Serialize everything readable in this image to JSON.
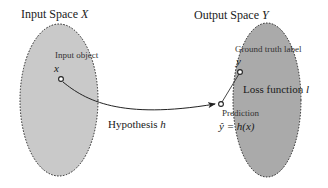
{
  "input_space": {
    "title": "Input Space ",
    "symbol": "X",
    "point_label": "Input object",
    "point_symbol": "x"
  },
  "output_space": {
    "title": "Output Space ",
    "symbol": "Y",
    "truth_label": "Ground truth label",
    "truth_symbol": "y",
    "prediction_label": "Prediction",
    "prediction_formula": "ŷ = h(x)"
  },
  "edges": {
    "hypothesis_label": "Hypothesis ",
    "hypothesis_symbol": "h",
    "loss_label": "Loss function ",
    "loss_symbol": "l"
  },
  "colors": {
    "input_fill": "#c8c8c8",
    "output_fill": "#a9a9a9",
    "stroke": "#222222"
  }
}
